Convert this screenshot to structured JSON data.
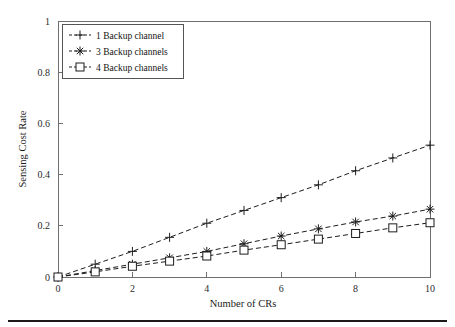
{
  "chart_data": {
    "type": "line",
    "title": "",
    "xlabel": "Number of CRs",
    "ylabel": "Sensing Cost Rate",
    "xlim": [
      0,
      10
    ],
    "ylim": [
      0,
      1
    ],
    "xticks": [
      0,
      2,
      4,
      6,
      8,
      10
    ],
    "xtick_labels": [
      "0",
      "2",
      "4",
      "6",
      "8",
      "10"
    ],
    "yticks": [
      0,
      0.2,
      0.4,
      0.6,
      0.8,
      1
    ],
    "ytick_labels": [
      "0",
      "0.2",
      "0.4",
      "0.6",
      "0.8",
      "1"
    ],
    "grid": false,
    "legend_position": "top-left",
    "x": [
      0,
      1,
      2,
      3,
      4,
      5,
      6,
      7,
      8,
      9,
      10
    ],
    "series": [
      {
        "name": "1 Backup channel",
        "marker": "plus",
        "linestyle": "dashed",
        "color": "#1d1d1d",
        "values": [
          0,
          0.05,
          0.1,
          0.155,
          0.21,
          0.26,
          0.31,
          0.36,
          0.415,
          0.465,
          0.515
        ]
      },
      {
        "name": "3 Backup channels",
        "marker": "asterisk",
        "linestyle": "dashed",
        "color": "#1d1d1d",
        "values": [
          0,
          0.025,
          0.05,
          0.075,
          0.1,
          0.13,
          0.16,
          0.188,
          0.215,
          0.238,
          0.265
        ]
      },
      {
        "name": "4 Backup channels",
        "marker": "square",
        "linestyle": "dashed",
        "color": "#1d1d1d",
        "values": [
          0,
          0.02,
          0.042,
          0.062,
          0.082,
          0.105,
          0.126,
          0.148,
          0.17,
          0.192,
          0.212
        ]
      }
    ]
  },
  "legend": {
    "entries": [
      {
        "label": "1 Backup channel"
      },
      {
        "label": "3 Backup channels"
      },
      {
        "label": "4 Backup channels"
      }
    ]
  },
  "axis": {
    "x_title": "Number of CRs",
    "y_title": "Sensing Cost Rate"
  }
}
